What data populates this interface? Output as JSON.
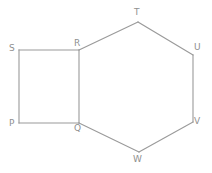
{
  "figure": {
    "type": "geometry-diagram",
    "background_color": "#ffffff",
    "line_color": "#9a9a9a",
    "label_color": "#8f8f8f",
    "canvas": {
      "width": 212,
      "height": 173
    },
    "vertices": [
      {
        "id": "P",
        "label": "P",
        "x": 19,
        "y": 123,
        "label_x": 9,
        "label_y": 119
      },
      {
        "id": "Q",
        "label": "Q",
        "x": 79,
        "y": 123,
        "label_x": 74,
        "label_y": 124
      },
      {
        "id": "R",
        "label": "R",
        "x": 79,
        "y": 50,
        "label_x": 74,
        "label_y": 39
      },
      {
        "id": "S",
        "label": "S",
        "x": 19,
        "y": 50,
        "label_x": 9,
        "label_y": 44
      },
      {
        "id": "T",
        "label": "T",
        "x": 138,
        "y": 22,
        "label_x": 134,
        "label_y": 8
      },
      {
        "id": "U",
        "label": "U",
        "x": 193,
        "y": 55,
        "label_x": 194,
        "label_y": 43
      },
      {
        "id": "V",
        "label": "V",
        "x": 193,
        "y": 122,
        "label_x": 194,
        "label_y": 117
      },
      {
        "id": "W",
        "label": "W",
        "x": 139,
        "y": 152,
        "label_x": 133,
        "label_y": 155
      }
    ],
    "edges": [
      {
        "id": "PQ",
        "from": "P",
        "to": "Q",
        "shape": "square",
        "x1": 19,
        "y1": 123,
        "x2": 79,
        "y2": 123
      },
      {
        "id": "QR",
        "from": "Q",
        "to": "R",
        "shape": "shared",
        "x1": 79,
        "y1": 123,
        "x2": 79,
        "y2": 50
      },
      {
        "id": "RS",
        "from": "R",
        "to": "S",
        "shape": "square",
        "x1": 79,
        "y1": 50,
        "x2": 19,
        "y2": 50
      },
      {
        "id": "SP",
        "from": "S",
        "to": "P",
        "shape": "square",
        "x1": 19,
        "y1": 50,
        "x2": 19,
        "y2": 123
      },
      {
        "id": "RT",
        "from": "R",
        "to": "T",
        "shape": "hexagon",
        "x1": 79,
        "y1": 50,
        "x2": 138,
        "y2": 22
      },
      {
        "id": "TU",
        "from": "T",
        "to": "U",
        "shape": "hexagon",
        "x1": 138,
        "y1": 22,
        "x2": 193,
        "y2": 55
      },
      {
        "id": "UV",
        "from": "U",
        "to": "V",
        "shape": "hexagon",
        "x1": 193,
        "y1": 55,
        "x2": 193,
        "y2": 122
      },
      {
        "id": "VW",
        "from": "V",
        "to": "W",
        "shape": "hexagon",
        "x1": 193,
        "y1": 122,
        "x2": 139,
        "y2": 152
      },
      {
        "id": "WQ",
        "from": "W",
        "to": "Q",
        "shape": "hexagon",
        "x1": 139,
        "y1": 152,
        "x2": 79,
        "y2": 123
      }
    ]
  }
}
